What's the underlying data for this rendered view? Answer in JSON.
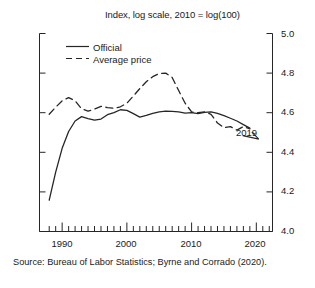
{
  "chart_data": {
    "type": "line",
    "title": "Index, log scale, 2010 = log(100)",
    "xlabel": "",
    "ylabel": "",
    "xlim": [
      1986.5,
      2022.5
    ],
    "ylim": [
      4.0,
      5.0
    ],
    "grid": false,
    "legend_position": "upper-left-inside",
    "y_ticks": [
      "5.0",
      "4.8",
      "4.6",
      "4.4",
      "4.2",
      "4.0"
    ],
    "y_tick_values": [
      5.0,
      4.8,
      4.6,
      4.4,
      4.2,
      4.0
    ],
    "x_ticks": [
      "1990",
      "2000",
      "2010",
      "2020"
    ],
    "x_tick_values": [
      1990,
      2000,
      2010,
      2020
    ],
    "x_minor_step": 1,
    "annotations": [
      {
        "text": "2019",
        "x": 2019.8,
        "y": 4.515
      }
    ],
    "series": [
      {
        "name": "Official",
        "style": "solid",
        "color": "#262626",
        "x": [
          1988,
          1989,
          1990,
          1991,
          1992,
          1993,
          1994,
          1995,
          1996,
          1997,
          1998,
          1999,
          2000,
          2001,
          2002,
          2003,
          2004,
          2005,
          2006,
          2007,
          2008,
          2009,
          2010,
          2011,
          2012,
          2013,
          2014,
          2015,
          2016,
          2017,
          2018,
          2019
        ],
        "values": [
          4.158,
          4.3,
          4.42,
          4.505,
          4.558,
          4.58,
          4.57,
          4.562,
          4.568,
          4.59,
          4.6,
          4.615,
          4.612,
          4.595,
          4.578,
          4.586,
          4.597,
          4.604,
          4.608,
          4.607,
          4.604,
          4.598,
          4.6,
          4.595,
          4.602,
          4.604,
          4.596,
          4.585,
          4.572,
          4.558,
          4.54,
          4.522
        ]
      },
      {
        "name": "Average price",
        "style": "dashed",
        "color": "#262626",
        "x": [
          1988,
          1989,
          1990,
          1991,
          1992,
          1993,
          1994,
          1995,
          1996,
          1997,
          1998,
          1999,
          2000,
          2001,
          2002,
          2003,
          2004,
          2005,
          2006,
          2007,
          2008,
          2009,
          2010,
          2011,
          2012,
          2013,
          2014,
          2015,
          2016,
          2017,
          2018,
          2019
        ],
        "values": [
          4.592,
          4.628,
          4.66,
          4.676,
          4.66,
          4.62,
          4.608,
          4.618,
          4.632,
          4.626,
          4.622,
          4.63,
          4.648,
          4.684,
          4.722,
          4.756,
          4.782,
          4.798,
          4.8,
          4.778,
          4.712,
          4.648,
          4.604,
          4.6,
          4.604,
          4.592,
          4.548,
          4.524,
          4.53,
          4.512,
          4.53,
          4.518
        ]
      }
    ]
  },
  "source": {
    "text": "Source: Bureau of Labor Statistics; Byrne and Corrado (2020)."
  },
  "legend": {
    "items": [
      {
        "label": "Official",
        "style": "solid"
      },
      {
        "label": "Average price",
        "style": "dashed"
      }
    ]
  }
}
